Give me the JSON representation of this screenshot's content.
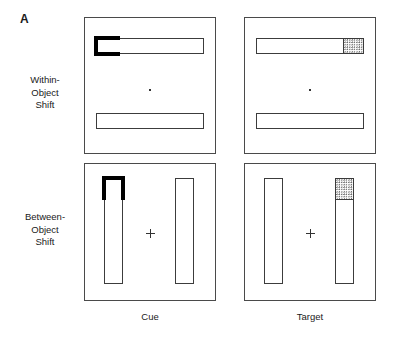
{
  "figure": {
    "panel_letter": "A",
    "caption_letter_name": "figure-panel-letter-a",
    "column_labels": {
      "cue": "Cue",
      "target": "Target"
    },
    "row_labels": {
      "within": {
        "line1": "Within-",
        "line2": "Object",
        "line3": "Shift"
      },
      "between": {
        "line1": "Between-",
        "line2": "Object",
        "line3": "Shift"
      }
    },
    "colors": {
      "frame_stroke": "#4a4a4a",
      "object_stroke": "#3c3c3c",
      "cue_fill": "#000000",
      "target_stipple": "#6e6e6e",
      "background": "#ffffff",
      "text": "#1a1a1a"
    },
    "panels": [
      {
        "id": "within-cue",
        "row": "Within-Object Shift",
        "column": "Cue",
        "objects": "two horizontal rectangles",
        "fixation": "dot",
        "marker": "cue bracket",
        "marker_location": "left end of upper horizontal rectangle"
      },
      {
        "id": "within-target",
        "row": "Within-Object Shift",
        "column": "Target",
        "objects": "two horizontal rectangles",
        "fixation": "dot",
        "marker": "stippled target square",
        "marker_location": "right end of upper horizontal rectangle"
      },
      {
        "id": "between-cue",
        "row": "Between-Object Shift",
        "column": "Cue",
        "objects": "two vertical rectangles",
        "fixation": "cross",
        "marker": "cue bracket",
        "marker_location": "top end of left vertical rectangle"
      },
      {
        "id": "between-target",
        "row": "Between-Object Shift",
        "column": "Target",
        "objects": "two vertical rectangles",
        "fixation": "cross",
        "marker": "stippled target square",
        "marker_location": "top end of right vertical rectangle"
      }
    ]
  }
}
